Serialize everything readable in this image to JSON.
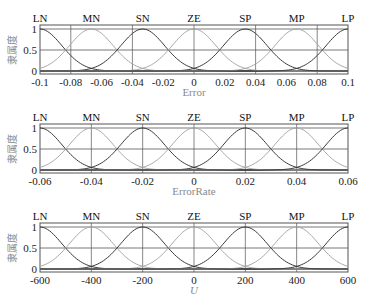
{
  "chart_data": [
    {
      "type": "line",
      "title": "",
      "xlabel": "Error",
      "ylabel": "隶属度",
      "xlim": [
        -0.1,
        0.1
      ],
      "ylim": [
        0,
        1
      ],
      "xticks": [
        "-0.1",
        "-0.08",
        "-0.06",
        "-0.04",
        "-0.02",
        "0",
        "0.02",
        "0.04",
        "0.06",
        "0.08",
        "0.1"
      ],
      "yticks": [
        "0",
        "0.5",
        "1"
      ],
      "grid": true,
      "membership_functions": [
        {
          "name": "LN",
          "shape": "gaussian",
          "center": -0.1
        },
        {
          "name": "MN",
          "shape": "gaussian",
          "center": -0.0667
        },
        {
          "name": "SN",
          "shape": "gaussian",
          "center": -0.0333
        },
        {
          "name": "ZE",
          "shape": "gaussian",
          "center": 0
        },
        {
          "name": "SP",
          "shape": "gaussian",
          "center": 0.0333
        },
        {
          "name": "MP",
          "shape": "gaussian",
          "center": 0.0667
        },
        {
          "name": "LP",
          "shape": "gaussian",
          "center": 0.1
        }
      ],
      "series": [
        {
          "name": "LN",
          "center": -0.1
        },
        {
          "name": "MN",
          "center": -0.0667
        },
        {
          "name": "SN",
          "center": -0.0333
        },
        {
          "name": "ZE",
          "center": 0
        },
        {
          "name": "SP",
          "center": 0.0333
        },
        {
          "name": "MP",
          "center": 0.0667
        },
        {
          "name": "LP",
          "center": 0.1
        }
      ],
      "sigma_fraction_of_range": 0.0707
    },
    {
      "type": "line",
      "title": "",
      "xlabel": "ErrorRate",
      "ylabel": "隶属度",
      "xlim": [
        -0.06,
        0.06
      ],
      "ylim": [
        0,
        1
      ],
      "xticks": [
        "-0.06",
        "-0.04",
        "-0.02",
        "0",
        "0.02",
        "0.04",
        "0.06"
      ],
      "yticks": [
        "0",
        "0.5",
        "1"
      ],
      "grid": true,
      "series": [
        {
          "name": "LN",
          "center": -0.06
        },
        {
          "name": "MN",
          "center": -0.04
        },
        {
          "name": "SN",
          "center": -0.02
        },
        {
          "name": "ZE",
          "center": 0
        },
        {
          "name": "SP",
          "center": 0.02
        },
        {
          "name": "MP",
          "center": 0.04
        },
        {
          "name": "LP",
          "center": 0.06
        }
      ],
      "sigma_fraction_of_range": 0.0707
    },
    {
      "type": "line",
      "title": "",
      "xlabel": "U",
      "ylabel": "隶属度",
      "xlim": [
        -600,
        600
      ],
      "ylim": [
        0,
        1
      ],
      "xticks": [
        "-600",
        "-400",
        "-200",
        "0",
        "200",
        "400",
        "600"
      ],
      "yticks": [
        "0",
        "0.5",
        "1"
      ],
      "grid": true,
      "series": [
        {
          "name": "LN",
          "center": -600
        },
        {
          "name": "MN",
          "center": -400
        },
        {
          "name": "SN",
          "center": -200
        },
        {
          "name": "ZE",
          "center": 0
        },
        {
          "name": "SP",
          "center": 200
        },
        {
          "name": "MP",
          "center": 400
        },
        {
          "name": "LP",
          "center": 600
        }
      ],
      "sigma_fraction_of_range": 0.0707
    }
  ],
  "panels": [
    {
      "xlabel": "Error",
      "ylabel": "隶属度",
      "xlabel_italic": false,
      "xticks": [
        "-0.1",
        "-0.08",
        "-0.06",
        "-0.04",
        "-0.02",
        "0",
        "0.02",
        "0.04",
        "0.06",
        "0.08",
        "0.1"
      ],
      "yticks": [
        "1",
        "0.5",
        "0"
      ],
      "mf_labels": [
        "LN",
        "MN",
        "SN",
        "ZE",
        "SP",
        "MP",
        "LP"
      ],
      "top": 25,
      "bottom": 74
    },
    {
      "xlabel": "ErrorRate",
      "ylabel": "隶属度",
      "xlabel_italic": false,
      "xticks": [
        "-0.06",
        "-0.04",
        "-0.02",
        "0",
        "0.02",
        "0.04",
        "0.06"
      ],
      "yticks": [
        "1",
        "0.5",
        "0"
      ],
      "mf_labels": [
        "LN",
        "MN",
        "SN",
        "ZE",
        "SP",
        "MP",
        "LP"
      ],
      "top": 124,
      "bottom": 173
    },
    {
      "xlabel": "U",
      "ylabel": "隶属度",
      "xlabel_italic": true,
      "xticks": [
        "-600",
        "-400",
        "-200",
        "0",
        "200",
        "400",
        "600"
      ],
      "yticks": [
        "1",
        "0.5",
        "0"
      ],
      "mf_labels": [
        "LN",
        "MN",
        "SN",
        "ZE",
        "SP",
        "MP",
        "LP"
      ],
      "top": 223,
      "bottom": 272
    }
  ],
  "colors": {
    "dark_curve": "#3a3a3a",
    "light_curve": "#a8a8a8",
    "grid": "#555555",
    "frame": "#555555",
    "axis_label": "#8a8a8a"
  }
}
